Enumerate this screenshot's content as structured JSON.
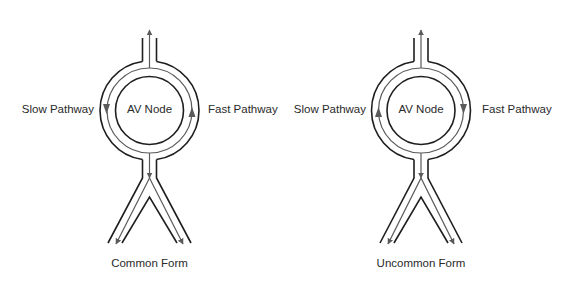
{
  "figure": {
    "colors": {
      "outline": "#1f1f1f",
      "pathway_arrow": "#5a5a5a",
      "background": "#ffffff",
      "text": "#2a2a2a"
    },
    "panels": [
      {
        "id": "common",
        "caption": "Common Form",
        "node_label": "AV Node",
        "left_label": "Slow Pathway",
        "right_label": "Fast Pathway",
        "slow_pathway_direction": "down",
        "fast_pathway_direction": "up",
        "exit_up_arrow": true,
        "exit_down_arrow": true,
        "branch_arrows": [
          "down-left",
          "down-right"
        ]
      },
      {
        "id": "uncommon",
        "caption": "Uncommon Form",
        "node_label": "AV Node",
        "left_label": "Slow Pathway",
        "right_label": "Fast Pathway",
        "slow_pathway_direction": "up",
        "fast_pathway_direction": "down",
        "exit_up_arrow": true,
        "exit_down_arrow": true,
        "branch_arrows": [
          "down-left",
          "down-right"
        ]
      }
    ]
  }
}
